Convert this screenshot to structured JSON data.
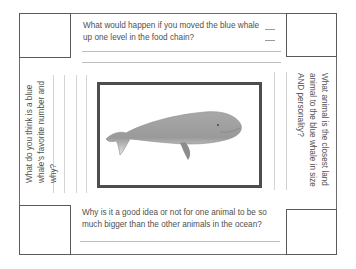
{
  "worksheet": {
    "top_question": "What would happen if you moved the blue whale up one level in the food chain?",
    "top_question_lines": [
      "What would happen if you moved the blue whale",
      "up one level in the food chain?"
    ],
    "left_question": "What do you think is a blue whale's favorite number and why?",
    "left_question_lines": [
      "What do you think is a blue",
      "whale's favorite number and",
      "why?"
    ],
    "right_question": "What animal is the closest land animal to the blue whale in size AND personality?",
    "right_question_lines": [
      "What animal is the closest land",
      "animal to the blue whale in size",
      "AND personality?"
    ],
    "bottom_question": "Why is it a good idea or not for one animal to be so much bigger than the other animals in the ocean?",
    "bottom_question_lines": [
      "Why is it a good idea or not for one animal to be so",
      "much bigger than the other animals in the ocean?"
    ],
    "center_image": "blue-whale-illustration"
  },
  "colors": {
    "border": "#6b6b6b",
    "frame": "#4d4d4d",
    "text": "#505050",
    "whale_body": "#9a9a9a"
  }
}
